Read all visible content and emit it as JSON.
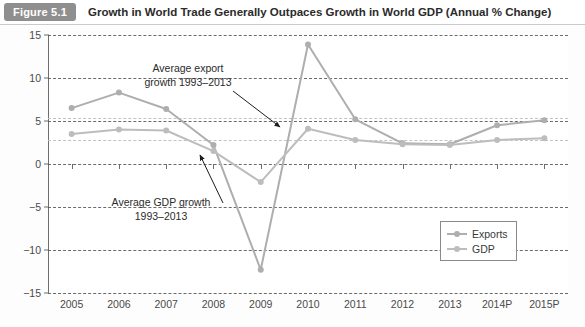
{
  "header": {
    "badge": "Figure 5.1",
    "title": "Growth in World Trade Generally Outpaces Growth in World GDP (Annual % Change)"
  },
  "chart_data": {
    "type": "line",
    "title": "Growth in World Trade Generally Outpaces Growth in World GDP (Annual % Change)",
    "xlabel": "",
    "ylabel": "",
    "ylim": [
      -15,
      15
    ],
    "yticks": [
      15,
      10,
      5,
      0,
      -5,
      -10,
      -15
    ],
    "ytick_labels": [
      "15",
      "10",
      "5",
      "0",
      "−5",
      "−10",
      "−15"
    ],
    "grid": true,
    "legend_position": "bottom-right",
    "categories": [
      "2005",
      "2006",
      "2007",
      "2008",
      "2009",
      "2010",
      "2011",
      "2012",
      "2013",
      "2014P",
      "2015P"
    ],
    "series": [
      {
        "name": "Exports",
        "color": "#aeaeae",
        "values": [
          6.5,
          8.3,
          6.4,
          2.2,
          -12.3,
          13.9,
          5.2,
          2.4,
          2.3,
          4.5,
          5.1
        ]
      },
      {
        "name": "GDP",
        "color": "#bdbdbd",
        "values": [
          3.5,
          4.0,
          3.9,
          1.5,
          -2.1,
          4.1,
          2.8,
          2.3,
          2.2,
          2.8,
          3.0
        ]
      }
    ],
    "reference_lines": [
      {
        "name": "Average export growth 1993–2013",
        "value": 5.3,
        "color": "#c3c3c3",
        "style": "dashed"
      },
      {
        "name": "Average GDP growth 1993–2013",
        "value": 2.8,
        "color": "#c3c3c3",
        "style": "dashed"
      }
    ],
    "annotations": [
      {
        "id": "export-annotation",
        "line1": "Average export",
        "line2": "growth 1993–2013",
        "text": "Average export growth 1993–2013",
        "points_to": "export average reference line"
      },
      {
        "id": "gdp-annotation",
        "line1": "Average GDP growth",
        "line2": "1993–2013",
        "text": "Average GDP growth 1993–2013",
        "points_to": "GDP average reference line"
      }
    ]
  },
  "legend": {
    "items": [
      {
        "label": "Exports",
        "color": "#aeaeae"
      },
      {
        "label": "GDP",
        "color": "#bdbdbd"
      }
    ]
  }
}
